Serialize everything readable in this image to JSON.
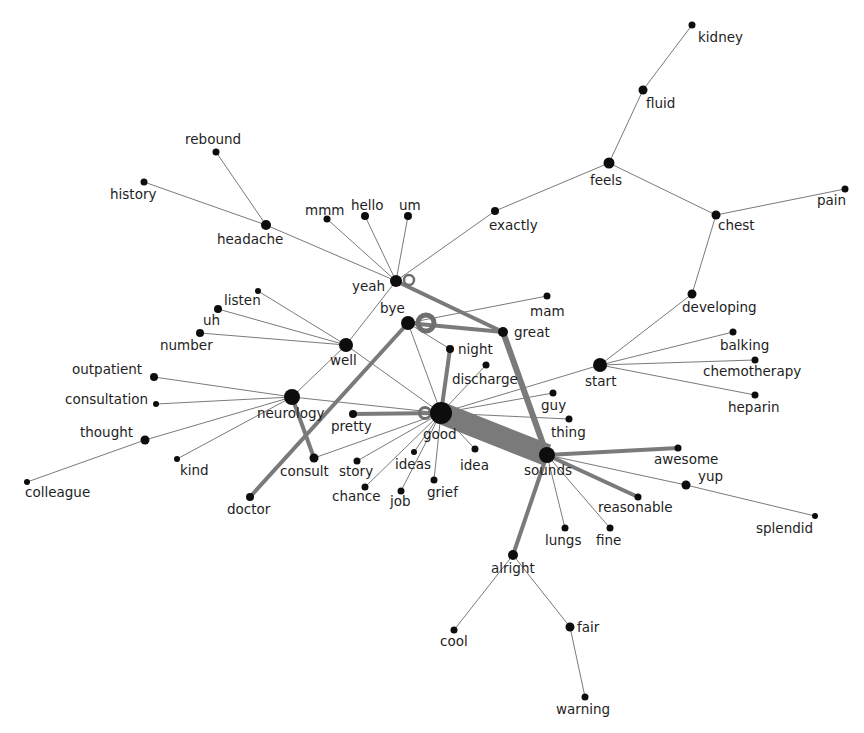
{
  "diagram": {
    "type": "word co-occurrence network",
    "colors": {
      "node": "#0d0d0d",
      "edge": "#7a7a7a",
      "label": "#1e1e1e",
      "background": "#ffffff"
    },
    "nodes": [
      {
        "id": "kidney",
        "x": 692,
        "y": 25,
        "r": 3.5,
        "lx": 698,
        "ly": 42
      },
      {
        "id": "fluid",
        "x": 643,
        "y": 90,
        "r": 4.5,
        "lx": 646,
        "ly": 108
      },
      {
        "id": "feels",
        "x": 609,
        "y": 163,
        "r": 5.5,
        "lx": 590,
        "ly": 185
      },
      {
        "id": "pain",
        "x": 845,
        "y": 189,
        "r": 3.5,
        "lx": 817,
        "ly": 205
      },
      {
        "id": "chest",
        "x": 716,
        "y": 215,
        "r": 4.5,
        "lx": 718,
        "ly": 230
      },
      {
        "id": "exactly",
        "x": 495,
        "y": 211,
        "r": 4,
        "lx": 489,
        "ly": 230
      },
      {
        "id": "rebound",
        "x": 216,
        "y": 152,
        "r": 3.5,
        "lx": 185,
        "ly": 144
      },
      {
        "id": "history",
        "x": 144,
        "y": 182,
        "r": 3.5,
        "lx": 110,
        "ly": 199
      },
      {
        "id": "headache",
        "x": 266,
        "y": 225,
        "r": 5,
        "lx": 217,
        "ly": 244
      },
      {
        "id": "mmm",
        "x": 327,
        "y": 219,
        "r": 3.5,
        "lx": 305,
        "ly": 215
      },
      {
        "id": "hello",
        "x": 365,
        "y": 216,
        "r": 4,
        "lx": 351,
        "ly": 210
      },
      {
        "id": "um",
        "x": 408,
        "y": 216,
        "r": 4,
        "lx": 399,
        "ly": 210
      },
      {
        "id": "yeah",
        "x": 396,
        "y": 281,
        "r": 6,
        "lx": 352,
        "ly": 291
      },
      {
        "id": "bye",
        "x": 408,
        "y": 323,
        "r": 7,
        "lx": 380,
        "ly": 313
      },
      {
        "id": "mam",
        "x": 547,
        "y": 296,
        "r": 3.5,
        "lx": 530,
        "ly": 316
      },
      {
        "id": "great",
        "x": 503,
        "y": 332,
        "r": 5,
        "lx": 514,
        "ly": 337
      },
      {
        "id": "developing",
        "x": 692,
        "y": 294,
        "r": 4.5,
        "lx": 682,
        "ly": 312
      },
      {
        "id": "listen",
        "x": 258,
        "y": 291,
        "r": 3,
        "lx": 224,
        "ly": 305
      },
      {
        "id": "uh",
        "x": 218,
        "y": 309,
        "r": 4,
        "lx": 203,
        "ly": 325
      },
      {
        "id": "number",
        "x": 200,
        "y": 333,
        "r": 4,
        "lx": 160,
        "ly": 350
      },
      {
        "id": "well",
        "x": 346,
        "y": 345,
        "r": 7,
        "lx": 330,
        "ly": 365
      },
      {
        "id": "night",
        "x": 450,
        "y": 349,
        "r": 4,
        "lx": 458,
        "ly": 354
      },
      {
        "id": "discharge",
        "x": 486,
        "y": 365,
        "r": 3.5,
        "lx": 452,
        "ly": 384
      },
      {
        "id": "balking",
        "x": 733,
        "y": 332,
        "r": 3.5,
        "lx": 720,
        "ly": 350
      },
      {
        "id": "chemotherapy",
        "x": 755,
        "y": 360,
        "r": 3.5,
        "lx": 703,
        "ly": 376
      },
      {
        "id": "start",
        "x": 600,
        "y": 365,
        "r": 7,
        "lx": 585,
        "ly": 386
      },
      {
        "id": "heparin",
        "x": 755,
        "y": 395,
        "r": 3.5,
        "lx": 728,
        "ly": 412
      },
      {
        "id": "outpatient",
        "x": 154,
        "y": 377,
        "r": 4,
        "lx": 72,
        "ly": 374
      },
      {
        "id": "consultation",
        "x": 156,
        "y": 404,
        "r": 3,
        "lx": 65,
        "ly": 404
      },
      {
        "id": "neurology",
        "x": 292,
        "y": 397,
        "r": 8,
        "lx": 257,
        "ly": 418
      },
      {
        "id": "guy",
        "x": 553,
        "y": 393,
        "r": 3.5,
        "lx": 541,
        "ly": 410
      },
      {
        "id": "thing",
        "x": 569,
        "y": 419,
        "r": 3.5,
        "lx": 551,
        "ly": 437
      },
      {
        "id": "pretty",
        "x": 353,
        "y": 414,
        "r": 4,
        "lx": 331,
        "ly": 431
      },
      {
        "id": "good",
        "x": 441,
        "y": 413,
        "r": 11,
        "lx": 423,
        "ly": 439
      },
      {
        "id": "thought",
        "x": 145,
        "y": 440,
        "r": 4.5,
        "lx": 80,
        "ly": 437
      },
      {
        "id": "ideas",
        "x": 414,
        "y": 452,
        "r": 3,
        "lx": 395,
        "ly": 469
      },
      {
        "id": "idea",
        "x": 475,
        "y": 449,
        "r": 3.5,
        "lx": 460,
        "ly": 470
      },
      {
        "id": "consult",
        "x": 314,
        "y": 458,
        "r": 4.5,
        "lx": 280,
        "ly": 476
      },
      {
        "id": "story",
        "x": 357,
        "y": 461,
        "r": 3.5,
        "lx": 339,
        "ly": 476
      },
      {
        "id": "kind",
        "x": 177,
        "y": 459,
        "r": 3,
        "lx": 180,
        "ly": 475
      },
      {
        "id": "sounds",
        "x": 547,
        "y": 455,
        "r": 8,
        "lx": 524,
        "ly": 475
      },
      {
        "id": "awesome",
        "x": 678,
        "y": 448,
        "r": 3.5,
        "lx": 654,
        "ly": 464
      },
      {
        "id": "yup",
        "x": 686,
        "y": 485,
        "r": 4.5,
        "lx": 698,
        "ly": 481
      },
      {
        "id": "grief",
        "x": 434,
        "y": 480,
        "r": 3.5,
        "lx": 427,
        "ly": 497
      },
      {
        "id": "chance",
        "x": 365,
        "y": 487,
        "r": 3.5,
        "lx": 332,
        "ly": 501
      },
      {
        "id": "job",
        "x": 401,
        "y": 491,
        "r": 3.5,
        "lx": 390,
        "ly": 506
      },
      {
        "id": "colleague",
        "x": 27,
        "y": 482,
        "r": 3,
        "lx": 25,
        "ly": 497
      },
      {
        "id": "reasonable",
        "x": 638,
        "y": 497,
        "r": 3.5,
        "lx": 598,
        "ly": 512
      },
      {
        "id": "doctor",
        "x": 250,
        "y": 497,
        "r": 4,
        "lx": 227,
        "ly": 514
      },
      {
        "id": "lungs",
        "x": 565,
        "y": 528,
        "r": 3.5,
        "lx": 545,
        "ly": 545
      },
      {
        "id": "fine",
        "x": 610,
        "y": 528,
        "r": 3.5,
        "lx": 596,
        "ly": 545
      },
      {
        "id": "splendid",
        "x": 815,
        "y": 516,
        "r": 3,
        "lx": 756,
        "ly": 533
      },
      {
        "id": "alright",
        "x": 513,
        "y": 555,
        "r": 5,
        "lx": 491,
        "ly": 573
      },
      {
        "id": "cool",
        "x": 454,
        "y": 630,
        "r": 3.5,
        "lx": 440,
        "ly": 646
      },
      {
        "id": "fair",
        "x": 570,
        "y": 627,
        "r": 4.5,
        "lx": 577,
        "ly": 632
      },
      {
        "id": "warning",
        "x": 585,
        "y": 697,
        "r": 3.5,
        "lx": 556,
        "ly": 714
      }
    ],
    "loops": [
      {
        "node": "yeah",
        "cx": 409,
        "cy": 280,
        "r": 5,
        "width": 2.5
      },
      {
        "node": "bye",
        "cx": 426,
        "cy": 323,
        "r": 8,
        "width": 5
      },
      {
        "node": "good",
        "cx": 425,
        "cy": 413,
        "r": 5.5,
        "width": 3
      }
    ],
    "edges": [
      {
        "source": "kidney",
        "target": "fluid",
        "w": 1
      },
      {
        "source": "fluid",
        "target": "feels",
        "w": 1
      },
      {
        "source": "feels",
        "target": "exactly",
        "w": 1
      },
      {
        "source": "feels",
        "target": "chest",
        "w": 1
      },
      {
        "source": "chest",
        "target": "pain",
        "w": 1
      },
      {
        "source": "chest",
        "target": "developing",
        "w": 1
      },
      {
        "source": "developing",
        "target": "start",
        "w": 1
      },
      {
        "source": "exactly",
        "target": "yeah",
        "w": 1
      },
      {
        "source": "rebound",
        "target": "headache",
        "w": 1
      },
      {
        "source": "history",
        "target": "headache",
        "w": 1
      },
      {
        "source": "headache",
        "target": "yeah",
        "w": 1
      },
      {
        "source": "mmm",
        "target": "yeah",
        "w": 1
      },
      {
        "source": "hello",
        "target": "yeah",
        "w": 1
      },
      {
        "source": "um",
        "target": "yeah",
        "w": 1
      },
      {
        "source": "yeah",
        "target": "well",
        "w": 1
      },
      {
        "source": "yeah",
        "target": "great",
        "w": 4
      },
      {
        "source": "bye",
        "target": "great",
        "w": 4
      },
      {
        "source": "bye",
        "target": "mam",
        "w": 1
      },
      {
        "source": "bye",
        "target": "doctor",
        "w": 4
      },
      {
        "source": "bye",
        "target": "good",
        "w": 1
      },
      {
        "source": "bye",
        "target": "night",
        "w": 1
      },
      {
        "source": "great",
        "target": "sounds",
        "w": 6
      },
      {
        "source": "listen",
        "target": "well",
        "w": 1
      },
      {
        "source": "uh",
        "target": "well",
        "w": 1
      },
      {
        "source": "number",
        "target": "well",
        "w": 1
      },
      {
        "source": "well",
        "target": "neurology",
        "w": 1
      },
      {
        "source": "well",
        "target": "good",
        "w": 1
      },
      {
        "source": "outpatient",
        "target": "neurology",
        "w": 1
      },
      {
        "source": "consultation",
        "target": "neurology",
        "w": 1
      },
      {
        "source": "thought",
        "target": "neurology",
        "w": 1
      },
      {
        "source": "colleague",
        "target": "thought",
        "w": 1
      },
      {
        "source": "kind",
        "target": "neurology",
        "w": 1
      },
      {
        "source": "neurology",
        "target": "consult",
        "w": 4
      },
      {
        "source": "neurology",
        "target": "good",
        "w": 1
      },
      {
        "source": "consult",
        "target": "good",
        "w": 1
      },
      {
        "source": "pretty",
        "target": "good",
        "w": 4
      },
      {
        "source": "night",
        "target": "good",
        "w": 4
      },
      {
        "source": "discharge",
        "target": "good",
        "w": 1
      },
      {
        "source": "start",
        "target": "good",
        "w": 1
      },
      {
        "source": "start",
        "target": "balking",
        "w": 1
      },
      {
        "source": "start",
        "target": "chemotherapy",
        "w": 1
      },
      {
        "source": "start",
        "target": "heparin",
        "w": 1
      },
      {
        "source": "guy",
        "target": "good",
        "w": 1
      },
      {
        "source": "thing",
        "target": "good",
        "w": 1
      },
      {
        "source": "good",
        "target": "sounds",
        "w": 22
      },
      {
        "source": "good",
        "target": "ideas",
        "w": 1
      },
      {
        "source": "good",
        "target": "idea",
        "w": 1
      },
      {
        "source": "good",
        "target": "grief",
        "w": 1
      },
      {
        "source": "good",
        "target": "story",
        "w": 1
      },
      {
        "source": "good",
        "target": "chance",
        "w": 1
      },
      {
        "source": "good",
        "target": "job",
        "w": 1
      },
      {
        "source": "sounds",
        "target": "awesome",
        "w": 4
      },
      {
        "source": "sounds",
        "target": "yup",
        "w": 1
      },
      {
        "source": "yup",
        "target": "splendid",
        "w": 1
      },
      {
        "source": "sounds",
        "target": "reasonable",
        "w": 4
      },
      {
        "source": "sounds",
        "target": "lungs",
        "w": 1
      },
      {
        "source": "sounds",
        "target": "fine",
        "w": 1
      },
      {
        "source": "sounds",
        "target": "alright",
        "w": 4
      },
      {
        "source": "alright",
        "target": "cool",
        "w": 1
      },
      {
        "source": "alright",
        "target": "fair",
        "w": 1
      },
      {
        "source": "fair",
        "target": "warning",
        "w": 1
      }
    ]
  }
}
